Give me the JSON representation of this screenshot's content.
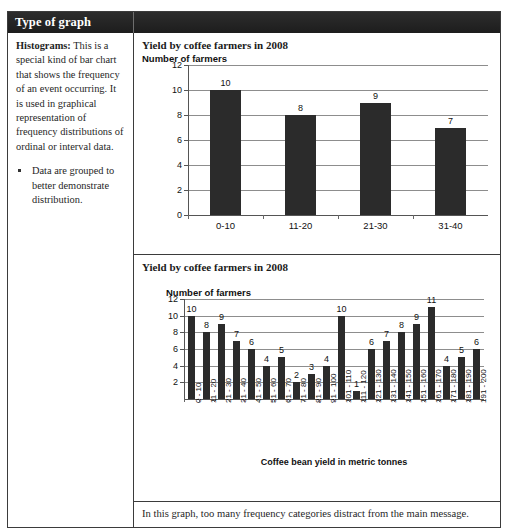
{
  "top_sliver": "",
  "table": {
    "header": {
      "col1": "Type of graph",
      "col2": ""
    }
  },
  "left_column": {
    "term": "Histograms:",
    "description": " This is a special kind of bar chart that shows the frequency of an event occurring. It is used in graphical representation of frequency distributions of ordinal or interval data.",
    "bullets": [
      "Data are grouped to better demonstrate distribution."
    ]
  },
  "footer": {
    "note": "In this graph, too many frequency categories distract from the main message."
  },
  "chart_data": [
    {
      "id": "chart-1",
      "type": "bar",
      "title": "Yield by coffee farmers in 2008",
      "ylabel": "Number of farmers",
      "xlabel": "",
      "categories": [
        "0-10",
        "11-20",
        "21-30",
        "31-40"
      ],
      "values": [
        10,
        8,
        9,
        7
      ],
      "yticks": [
        0,
        2,
        4,
        6,
        8,
        10,
        12
      ],
      "ylim": [
        0,
        12
      ],
      "grid": true,
      "legend": "none",
      "data_labels": true
    },
    {
      "id": "chart-2",
      "type": "bar",
      "title": "Yield by coffee farmers in 2008",
      "ylabel": "Number of farmers",
      "xlabel": "Coffee bean yield in metric tonnes",
      "categories": [
        "0 - 10",
        "11 - 20",
        "21 - 30",
        "31 - 40",
        "41 - 50",
        "51 - 60",
        "61 - 70",
        "71 - 80",
        "81 - 90",
        "91 - 100",
        "101 - 110",
        "111 - 120",
        "121 - 130",
        "131 - 140",
        "141 - 150",
        "151 - 160",
        "161 - 170",
        "171 - 180",
        "181 - 190",
        "191 - 200"
      ],
      "values": [
        10,
        8,
        9,
        7,
        6,
        4,
        5,
        2,
        3,
        4,
        10,
        1,
        6,
        7,
        8,
        9,
        11,
        4,
        5,
        6
      ],
      "yticks": [
        2,
        4,
        6,
        8,
        10,
        12
      ],
      "ylim": [
        0,
        12
      ],
      "grid": true,
      "legend": "none",
      "data_labels": true
    }
  ],
  "colors": {
    "bar": "#2b2b2b",
    "header_bg": "#262626",
    "header_text": "#ffffff",
    "grid": "#8d8d8d",
    "border": "#3b3b3b"
  }
}
